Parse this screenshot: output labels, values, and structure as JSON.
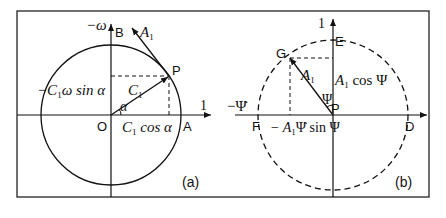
{
  "figure": {
    "frame": {
      "x": 17,
      "y": 11,
      "width": 413,
      "height": 186,
      "color": "#333333"
    },
    "panel_a": {
      "caption": "(a)",
      "origin": {
        "x": 111,
        "y": 115
      },
      "circle": {
        "cx": 111,
        "cy": 115,
        "r": 70,
        "style": "solid"
      },
      "point_P": {
        "x": 169,
        "y": 76
      },
      "labels": {
        "O": "O",
        "A": "A",
        "B": "B",
        "P": "P",
        "x_axis": "1",
        "y_axis": "−ω",
        "vector_C1": "C",
        "vector_C1_sub": "1",
        "vector_A1": "A",
        "vector_A1_sub": "1",
        "angle": "α",
        "horiz_proj_C": "C",
        "horiz_proj_sub": "1",
        "horiz_proj_rest": " cos α",
        "vert_proj_prefix": "−C",
        "vert_proj_sub": "1",
        "vert_proj_rest": "ω sin α"
      }
    },
    "panel_b": {
      "caption": "(b)",
      "origin": {
        "x": 333,
        "y": 115
      },
      "circle": {
        "cx": 333,
        "cy": 115,
        "r": 72,
        "style": "dashed"
      },
      "point_G": {
        "x": 290,
        "y": 58
      },
      "labels": {
        "P": "P",
        "G": "G",
        "D": "D",
        "E": "E",
        "F": "F",
        "y_axis": "1",
        "x_axis": "−Ψ̇",
        "vector_A1": "A",
        "vector_A1_sub": "1",
        "angle": "Ψ",
        "vert_proj_A": "A",
        "vert_proj_sub": "1",
        "vert_proj_rest": " cos Ψ",
        "horiz_proj_prefix": "− A",
        "horiz_proj_sub": "1",
        "horiz_proj_rest": "Ψ̇ sin Ψ"
      }
    },
    "colors": {
      "stroke": "#111111",
      "text": "#111111"
    }
  }
}
